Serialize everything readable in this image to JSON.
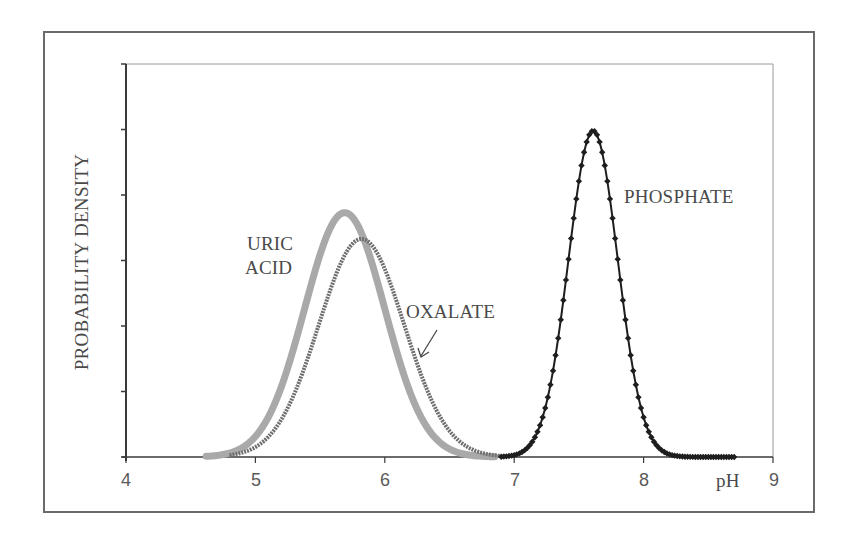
{
  "chart_data": {
    "type": "line",
    "title": "",
    "xlabel": "pH",
    "ylabel": "PROBABILITY DENSITY",
    "xlim": [
      4,
      9
    ],
    "ylim": [
      0,
      6
    ],
    "x_ticks": [
      "4",
      "5",
      "6",
      "7",
      "8",
      "9"
    ],
    "y_ticks_labeled": false,
    "grid": false,
    "legend": "none (inline curve labels)",
    "series": [
      {
        "name": "URIC ACID",
        "label_lines": [
          "URIC",
          "ACID"
        ],
        "distribution": "normal",
        "mean": 5.69,
        "sd": 0.31,
        "peak": 3.73,
        "x_range": [
          4.62,
          6.85
        ],
        "color": "#a9a9a9",
        "style": "thick light gray line"
      },
      {
        "name": "OXALATE",
        "label_lines": [
          "OXALATE"
        ],
        "distribution": "normal",
        "mean": 5.82,
        "sd": 0.33,
        "peak": 3.33,
        "x_range": [
          4.8,
          6.9
        ],
        "color": "#6f6f6f",
        "style": "dark gray dotted line, arrow-annotated"
      },
      {
        "name": "PHOSPHATE",
        "label_lines": [
          "PHOSPHATE"
        ],
        "distribution": "normal",
        "mean": 7.61,
        "sd": 0.19,
        "peak": 4.98,
        "x_range": [
          6.9,
          8.7
        ],
        "color": "#1e1e1e",
        "style": "black diamond markers"
      }
    ],
    "annotations": [
      {
        "text": "URIC ACID",
        "near_x": 5.25,
        "near_y": 3.2
      },
      {
        "text": "OXALATE",
        "near_x": 6.55,
        "near_y": 2.2,
        "arrow_to": [
          6.3,
          1.45
        ]
      },
      {
        "text": "PHOSPHATE",
        "near_x": 8.3,
        "near_y": 4.0
      }
    ]
  },
  "labels": {
    "uric_line1": "URIC",
    "uric_line2": "ACID",
    "oxalate": "OXALATE",
    "phosphate": "PHOSPHATE",
    "xlabel": "pH",
    "ylabel": "PROBABILITY DENSITY",
    "ticks": [
      "4",
      "5",
      "6",
      "7",
      "8",
      "9"
    ]
  }
}
